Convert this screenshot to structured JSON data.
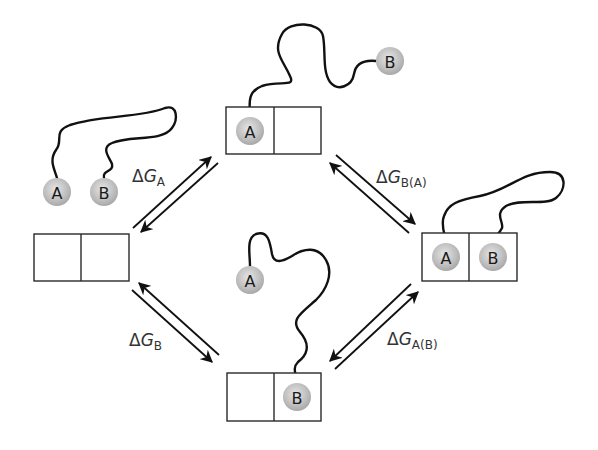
{
  "diagram": {
    "type": "thermodynamic-cycle",
    "colors": {
      "ball_fill": "#b9b9b9",
      "ball_highlight": "#e6e6e6",
      "line": "#111111",
      "box_stroke": "#2a2a2a",
      "label": "#333333"
    },
    "states": [
      {
        "id": "unbound",
        "position": "left",
        "balls": [
          {
            "label": "A"
          },
          {
            "label": "B"
          }
        ],
        "box": "empty"
      },
      {
        "id": "A-bound",
        "position": "top",
        "balls": [
          {
            "label": "A"
          },
          {
            "label": "B"
          }
        ],
        "box": "A in left site"
      },
      {
        "id": "both-bound",
        "position": "right",
        "balls": [
          {
            "label": "A"
          },
          {
            "label": "B"
          }
        ],
        "box": "A and B in sites"
      },
      {
        "id": "B-bound",
        "position": "bottom",
        "balls": [
          {
            "label": "A"
          },
          {
            "label": "B"
          }
        ],
        "box": "B in right site"
      }
    ],
    "labels": {
      "dg_a": {
        "delta": "Δ",
        "g": "G",
        "sub": "A"
      },
      "dg_b_a": {
        "delta": "Δ",
        "g": "G",
        "sub": "B(A)"
      },
      "dg_b": {
        "delta": "Δ",
        "g": "G",
        "sub": "B"
      },
      "dg_a_b": {
        "delta": "Δ",
        "g": "G",
        "sub": "A(B)"
      }
    },
    "balls": {
      "left_a": "A",
      "left_b": "B",
      "top_a": "A",
      "top_b": "B",
      "right_a": "A",
      "right_b": "B",
      "bottom_a": "A",
      "bottom_b": "B"
    }
  }
}
